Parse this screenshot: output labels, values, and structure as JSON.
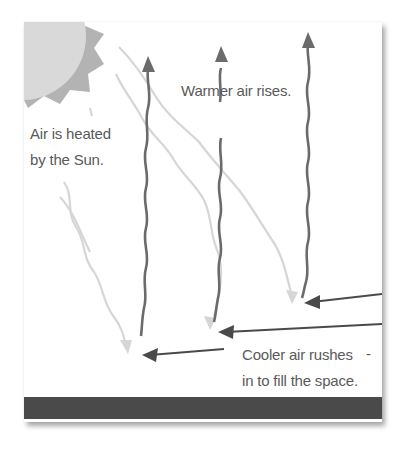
{
  "diagram": {
    "labels": {
      "heated_line1": "Air is heated",
      "heated_line2": "by the Sun.",
      "warmer": "Warmer air rises.",
      "cooler_line1": "Cooler air rushes",
      "cooler_line2": "in to fill the space.",
      "dash": "-"
    },
    "colors": {
      "sun_core": "#d9d9d9",
      "sun_rays": "#b3b3b3",
      "rising_arrows": "#6b6b6b",
      "sun_heat_lines": "#d6d6d6",
      "cooler_arrows": "#4a4a4a",
      "ground": "#4a4a4a",
      "text": "#5a5a5a"
    },
    "elements": [
      {
        "type": "sun",
        "position": "top-left corner"
      },
      {
        "type": "heat-line",
        "count": 3,
        "direction": "down-right",
        "color": "light-grey"
      },
      {
        "type": "rising-arrow",
        "count": 3,
        "direction": "up",
        "color": "mid-grey"
      },
      {
        "type": "inflow-arrow",
        "count": 3,
        "direction": "left",
        "color": "dark-grey"
      },
      {
        "type": "ground-bar",
        "color": "dark-grey"
      }
    ]
  }
}
